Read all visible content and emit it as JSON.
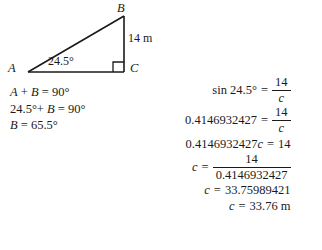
{
  "figure": {
    "name": "right-triangle-diagram",
    "vertices": {
      "A": "A",
      "B": "B",
      "C": "C"
    },
    "side_label": "14 m",
    "angle_label": "24.5°",
    "right_angle_at": "C"
  },
  "angle_work": {
    "line1": "A + B = 90°",
    "line2": "24.5°+ B = 90°",
    "line3": "B = 65.5°",
    "line1_parts": {
      "a": "A",
      "plus": "+",
      "b": "B",
      "eq": "=",
      "value": "90°"
    },
    "line2_parts": {
      "a": "24.5°+",
      "b": "B",
      "eq": "=",
      "value": "90°"
    },
    "line3_parts": {
      "b": "B",
      "eq": "=",
      "value": "65.5°"
    }
  },
  "solution": {
    "row1": {
      "lhs": "sin 24.5°",
      "eq": "=",
      "numer": "14",
      "denom": "c"
    },
    "row2": {
      "lhs": "0.4146932427",
      "eq": "=",
      "numer": "14",
      "denom": "c"
    },
    "row3": {
      "lhs_num": "0.4146932427",
      "lhs_var": "c",
      "eq": "=",
      "rhs": "14"
    },
    "row4": {
      "lhs": "c",
      "eq": "=",
      "numer": "14",
      "denom": "0.4146932427"
    },
    "row5": {
      "lhs": "c",
      "eq": "=",
      "rhs": "33.75989421"
    },
    "row6": {
      "lhs": "c",
      "eq": "=",
      "rhs": "33.76 m"
    }
  },
  "colors": {
    "ink": "#1a1a1a",
    "background": "#ffffff"
  }
}
